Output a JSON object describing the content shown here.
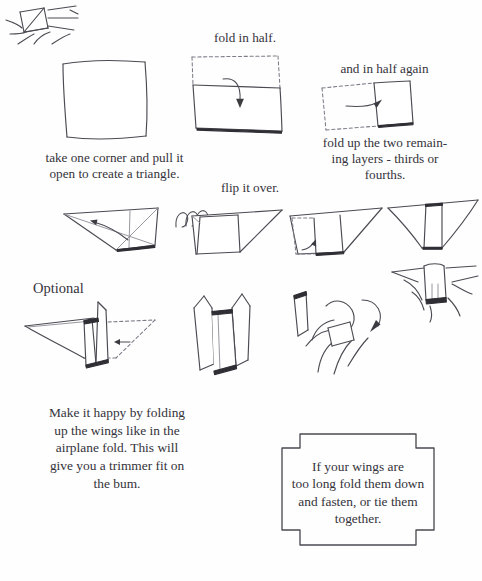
{
  "page": {
    "background_color": "#fefefe",
    "ink_color": "#4a4a52"
  },
  "captions": {
    "fold_in_half": "fold in half.",
    "and_in_half_again": "and in half again",
    "take_one_corner": "take one corner and pull it\nopen to create a triangle.",
    "flip_it_over": "flip it over.",
    "fold_up_two_layers": "fold up the two remain-\ning layers - thirds or\nfourths.",
    "optional": "Optional"
  },
  "body_text": {
    "make_it_happy": "Make it happy by folding\nup the wings like in the\nairplane fold. This will\ngive you a trimmer fit on\nthe bum."
  },
  "note_box": {
    "text": "If your wings are\ntoo long fold them down\nand fasten, or tie them\ntogether."
  },
  "figures": {
    "square": "hand-drawn-square",
    "fold_half": "rectangle-folded-in-half-with-arrow",
    "fold_half_again": "rectangle-folded-again-with-arrow",
    "triangle_open": "triangle-with-diagonal-creases",
    "flip_spiral": "spiral-flip-arrow",
    "triangle_flipped": "flipped-triangle-with-square",
    "triangle_fold_layers": "triangle-with-dashed-fold-and-arrow",
    "triangle_narrow": "triangle-with-center-band",
    "optional_perspective": "three-dimensional-fold-with-dashed-wing",
    "u_shape": "two-pronged-folded-form",
    "hand_hold_1": "hand-holding-fold-with-arrow",
    "hand_hold_2": "hand-holding-fold-top",
    "hand_hold_3": "hand-holding-fold-bottom"
  }
}
